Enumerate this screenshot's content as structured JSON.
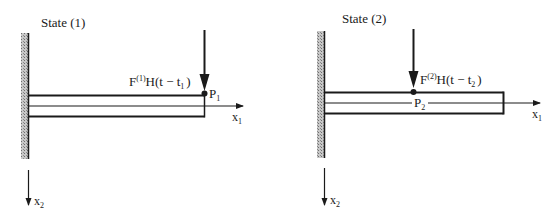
{
  "figure": {
    "panels": [
      {
        "title": "State (1)",
        "force_label": {
          "F": "F",
          "sup": "(1)",
          "body": "H(t − t",
          "sub": "1",
          "close": ")"
        },
        "point_label": {
          "base": "P",
          "sub": "1"
        },
        "axis_x1": {
          "base": "x",
          "sub": "1"
        },
        "axis_x2": {
          "base": "x",
          "sub": "2"
        },
        "load_position": "free end of cantilever"
      },
      {
        "title": "State (2)",
        "force_label": {
          "F": "F",
          "sup": "(2)",
          "body": "H(t − t",
          "sub": "2",
          "close": ")"
        },
        "point_label": {
          "base": "P",
          "sub": "2"
        },
        "axis_x1": {
          "base": "x",
          "sub": "1"
        },
        "axis_x2": {
          "base": "x",
          "sub": "2"
        },
        "load_position": "mid-span of cantilever"
      }
    ],
    "colors": {
      "ink": "#1a1a1a",
      "wall_hatch": "#9a9a9a"
    }
  }
}
